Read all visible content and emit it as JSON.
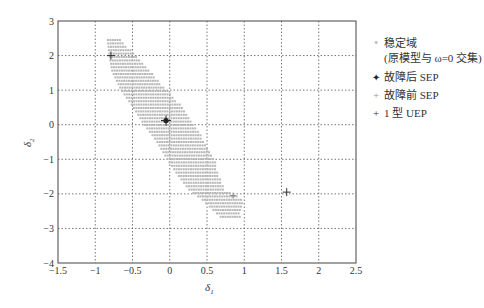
{
  "chart_data": {
    "type": "scatter",
    "title": "",
    "xlabel": "δ1",
    "ylabel": "δ2",
    "xlim": [
      -1.5,
      2.5
    ],
    "ylim": [
      -4,
      3
    ],
    "grid": true,
    "legend_position": "right-outside",
    "xticks": [
      "-1.5",
      "-1",
      "-0.5",
      "0",
      "0.5",
      "1",
      "1.5",
      "2",
      "2.5"
    ],
    "yticks": [
      "3",
      "2",
      "1",
      "0",
      "-1",
      "-2",
      "-3",
      "-4"
    ],
    "series": [
      {
        "name": "稳定域 (原模型与 ω=0 交集)",
        "marker": "small gray dot",
        "color": "#b8b8b8",
        "region_rows": [
          {
            "y": 2.45,
            "x_min": -0.83,
            "x_max": -0.66
          },
          {
            "y": 2.0,
            "x_min": -0.81,
            "x_max": -0.45
          },
          {
            "y": 1.55,
            "x_min": -0.77,
            "x_max": -0.26
          },
          {
            "y": 1.0,
            "x_min": -0.65,
            "x_max": -0.04
          },
          {
            "y": 0.55,
            "x_min": -0.5,
            "x_max": 0.15
          },
          {
            "y": 0.0,
            "x_min": -0.34,
            "x_max": 0.32
          },
          {
            "y": -0.45,
            "x_min": -0.18,
            "x_max": 0.46
          },
          {
            "y": -1.0,
            "x_min": -0.03,
            "x_max": 0.6
          },
          {
            "y": -1.45,
            "x_min": 0.11,
            "x_max": 0.66
          },
          {
            "y": -1.9,
            "x_min": 0.27,
            "x_max": 0.73
          },
          {
            "y": -2.15,
            "x_min": 0.43,
            "x_max": 0.99
          },
          {
            "y": -2.7,
            "x_min": 0.7,
            "x_max": 0.94
          }
        ]
      },
      {
        "name": "故障后 SEP",
        "marker": "filled star",
        "color": "#222222",
        "points": [
          {
            "x": -0.05,
            "y": 0.12
          }
        ]
      },
      {
        "name": "故障前 SEP",
        "marker": "small plus",
        "color": "#888888",
        "points": [
          {
            "x": 0.85,
            "y": -2.05
          }
        ]
      },
      {
        "name": "1 型 UEP",
        "marker": "plus",
        "color": "#333333",
        "points": [
          {
            "x": -0.79,
            "y": 2.0
          },
          {
            "x": 1.57,
            "y": -1.95
          }
        ]
      }
    ]
  },
  "legend": {
    "items": [
      {
        "symbol": "•",
        "label": "稳定域",
        "label2": "(原模型与 ω=0 交集)"
      },
      {
        "symbol": "✦",
        "label": "故障后 SEP"
      },
      {
        "symbol": "+",
        "label": "故障前 SEP"
      },
      {
        "symbol": "+",
        "label": "1 型 UEP"
      }
    ]
  },
  "axes": {
    "xlabel_main": "δ",
    "xlabel_sub": "1",
    "ylabel_main": "δ",
    "ylabel_sub": "2"
  }
}
